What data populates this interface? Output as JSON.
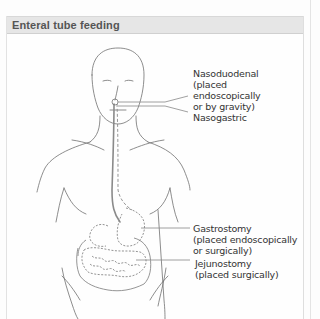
{
  "panel": {
    "title": "Enteral tube feeding"
  },
  "labels": {
    "nasoduodenal": "Nasoduodenal\n(placed\nendoscopically\nor by gravity)",
    "nasogastric": "Nasogastric",
    "gastrostomy": "Gastrostomy\n(placed endoscopically\nor surgically)",
    "jejunostomy": "Jejunostomy\n(placed surgically)"
  },
  "colors": {
    "outline": "#6a6a6a",
    "tube": "#8a8a8a",
    "header_bg": "#e6e6e6",
    "text": "#333333"
  }
}
